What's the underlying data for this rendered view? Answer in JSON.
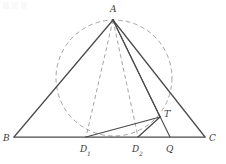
{
  "figure": {
    "background_color": "#ffffff",
    "solid_stroke_color": "#4a4a4a",
    "dashed_stroke_color": "#9a9a9a",
    "label_color": "#3b3b3b",
    "labels": {
      "a": "A",
      "b": "B",
      "c": "C",
      "d1_letter": "D",
      "d1_subscript": "1",
      "d2_letter": "D",
      "d2_subscript": "2",
      "q": "Q",
      "t_letter": "T",
      "t_prime": "′"
    },
    "points": {
      "A": {
        "x": 113,
        "y": 20
      },
      "B": {
        "x": 14,
        "y": 137
      },
      "C": {
        "x": 205,
        "y": 137
      },
      "D1": {
        "x": 86,
        "y": 137
      },
      "D2": {
        "x": 138,
        "y": 137
      },
      "Q": {
        "x": 170,
        "y": 137
      },
      "T": {
        "x": 160,
        "y": 117
      }
    },
    "circle": {
      "cx": 114,
      "cy": 78,
      "r": 58,
      "style": "dashed"
    },
    "segments": [
      {
        "name": "segment-AB",
        "from": "A",
        "to": "B",
        "style": "solid"
      },
      {
        "name": "segment-AC",
        "from": "A",
        "to": "C",
        "style": "solid"
      },
      {
        "name": "segment-BC",
        "from": "B",
        "to": "C",
        "style": "solid"
      },
      {
        "name": "segment-AD1",
        "from": "A",
        "to": "D1",
        "style": "dashed"
      },
      {
        "name": "segment-AD2",
        "from": "A",
        "to": "D2",
        "style": "dashed"
      },
      {
        "name": "segment-AQ",
        "from": "A",
        "to": "Q",
        "style": "solid"
      },
      {
        "name": "segment-AT",
        "from": "A",
        "to": "T",
        "style": "solid"
      },
      {
        "name": "segment-D1T",
        "from": "D1",
        "to": "T",
        "style": "solid"
      },
      {
        "name": "segment-D2T",
        "from": "D2",
        "to": "T",
        "style": "solid"
      }
    ]
  }
}
